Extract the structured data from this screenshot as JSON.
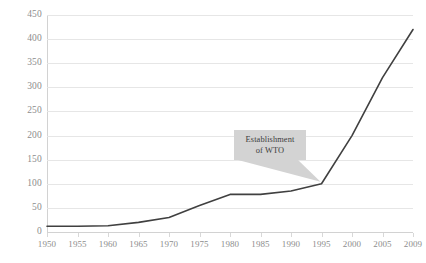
{
  "chart_data": {
    "type": "line",
    "title": "",
    "xlabel": "",
    "ylabel": "",
    "categories": [
      "1950",
      "1955",
      "1960",
      "1965",
      "1970",
      "1975",
      "1980",
      "1985",
      "1990",
      "1995",
      "2000",
      "2005",
      "2009"
    ],
    "values": [
      12,
      12,
      13,
      20,
      30,
      55,
      78,
      78,
      85,
      100,
      200,
      320,
      420
    ],
    "series": [
      {
        "name": "",
        "values": [
          12,
          12,
          13,
          20,
          30,
          55,
          78,
          78,
          85,
          100,
          200,
          320,
          420
        ]
      }
    ],
    "ylim": [
      0,
      450
    ],
    "ytick_step": 50,
    "yticks": [
      "0",
      "50",
      "100",
      "150",
      "200",
      "250",
      "300",
      "350",
      "400",
      "450"
    ],
    "grid": true,
    "legend": "none",
    "line_color": "#404040",
    "grid_color": "#e6e6e6",
    "axis_color": "#d2d2d2",
    "tick_label_color": "#8d8d8d",
    "background": "#ffffff",
    "annotations": [
      {
        "text_line1": "Establishment",
        "text_line2": "of WTO",
        "points_to_category": "1995",
        "points_to_value": 100,
        "box_color": "#d3d3d3",
        "text_color": "#3d3d3d"
      }
    ]
  }
}
